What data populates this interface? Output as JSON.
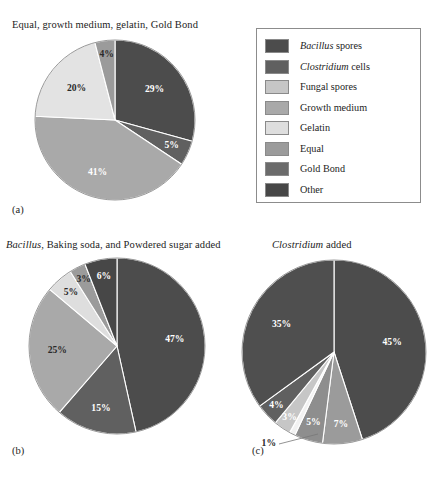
{
  "figure": {
    "background": "#ffffff",
    "label_a": "(a)",
    "label_b": "(b)",
    "label_c": "(c)"
  },
  "legend": {
    "title": "",
    "position": "top-right",
    "border_color": "#8c8c8c",
    "items": [
      {
        "label": "Bacillus spores",
        "genus": "Bacillus",
        "rest": " spores",
        "color": "#4c4c4c"
      },
      {
        "label": "Clostridium cells",
        "genus": "Clostridium",
        "rest": " cells",
        "color": "#606060"
      },
      {
        "label": "Fungal spores",
        "genus": "",
        "rest": "Fungal spores",
        "color": "#c6c6c6"
      },
      {
        "label": "Growth medium",
        "genus": "",
        "rest": "Growth medium",
        "color": "#a9a9a9"
      },
      {
        "label": "Gelatin",
        "genus": "",
        "rest": "Gelatin",
        "color": "#dedede"
      },
      {
        "label": "Equal",
        "genus": "",
        "rest": "Equal",
        "color": "#9b9b9b"
      },
      {
        "label": "Gold Bond",
        "genus": "",
        "rest": "Gold Bond",
        "color": "#6b6b6b"
      },
      {
        "label": "Other",
        "genus": "",
        "rest": "Other",
        "color": "#474747"
      }
    ]
  },
  "chart_data": [
    {
      "id": "a",
      "type": "pie",
      "title": "Equal, growth medium, gelatin, Gold Bond",
      "title_genus": "",
      "title_rest": "Equal, growth medium, gelatin, Gold Bond",
      "caption": "(a)",
      "center": [
        115,
        120
      ],
      "radius": 80,
      "start_angle": 0,
      "categories": [
        "Bacillus spores",
        "Clostridium cells",
        "Equal",
        "Gelatin",
        "Growth medium"
      ],
      "values": [
        29,
        5,
        41,
        20,
        4
      ],
      "labels": [
        "29%",
        "5%",
        "41%",
        "20%",
        "4%"
      ],
      "colors": [
        "#4c4c4c",
        "#606060",
        "#a9a9a9",
        "#e3e3e3",
        "#9b9b9b"
      ],
      "label_colors": [
        "light",
        "light",
        "light",
        "dark",
        "dark"
      ],
      "label_radius_frac": [
        0.62,
        0.78,
        0.7,
        0.62,
        0.82
      ]
    },
    {
      "id": "b",
      "type": "pie",
      "title": "Bacillus, Baking soda, and Powdered sugar added",
      "title_genus": "Bacillus",
      "title_rest": ", Baking soda, and Powdered sugar added",
      "caption": "(b)",
      "center": [
        117,
        346
      ],
      "radius": 88,
      "start_angle": 0,
      "categories": [
        "Bacillus spores",
        "Clostridium cells",
        "Growth medium",
        "Gelatin",
        "Equal",
        "Other"
      ],
      "values": [
        47,
        15,
        25,
        5,
        3,
        6
      ],
      "labels": [
        "47%",
        "15%",
        "25%",
        "5%",
        "3%",
        "6%"
      ],
      "colors": [
        "#4c4c4c",
        "#606060",
        "#a9a9a9",
        "#dedede",
        "#9b9b9b",
        "#474747"
      ],
      "label_colors": [
        "light",
        "light",
        "dark",
        "dark",
        "dark",
        "light"
      ],
      "label_radius_frac": [
        0.66,
        0.74,
        0.68,
        0.8,
        0.84,
        0.8
      ]
    },
    {
      "id": "c",
      "type": "pie",
      "title": "Clostridium added",
      "title_genus": "Clostridium",
      "title_rest": " added",
      "caption": "(c)",
      "center": [
        334,
        352
      ],
      "radius": 92,
      "start_angle": 0,
      "categories": [
        "Bacillus spores",
        "Growth medium",
        "Equal",
        "Gelatin",
        "Fungal spores",
        "Clostridium cells",
        "Other"
      ],
      "values": [
        45,
        7,
        5,
        1,
        3,
        4,
        35
      ],
      "labels": [
        "45%",
        "7%",
        "5%",
        "1%",
        "3%",
        "4%",
        "35%"
      ],
      "colors": [
        "#4c4c4c",
        "#9b9b9b",
        "#8e8e8e",
        "#f2f2f2",
        "#c6c6c6",
        "#606060",
        "#4f4f4f"
      ],
      "label_colors": [
        "light",
        "light",
        "light",
        "leader",
        "light",
        "light",
        "light"
      ],
      "label_radius_frac": [
        0.64,
        0.8,
        0.8,
        0.0,
        0.86,
        0.86,
        0.64
      ],
      "leader": {
        "label": "1%",
        "from": [
          318,
          434
        ],
        "to": [
          279,
          444
        ],
        "text_at": [
          276,
          444
        ]
      }
    }
  ]
}
